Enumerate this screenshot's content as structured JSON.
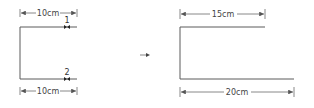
{
  "diagram": {
    "left_figure": {
      "top_dimension": "10cm",
      "bottom_dimension": "10cm",
      "markers": [
        {
          "label": "1",
          "position": "top"
        },
        {
          "label": "2",
          "position": "bottom"
        }
      ]
    },
    "transition_arrow": "→",
    "right_figure": {
      "top_dimension": "15cm",
      "bottom_dimension": "20cm"
    },
    "colors": {
      "line": "#5a5a5a",
      "text": "#444444"
    }
  }
}
